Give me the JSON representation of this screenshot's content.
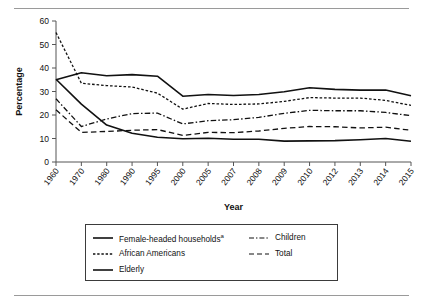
{
  "figure": {
    "has_top_rule": true,
    "has_bottom_rule": true,
    "rule_color": "#9a9a9a"
  },
  "chart_data": {
    "type": "line",
    "title": "",
    "xlabel": "Year",
    "ylabel": "Percentage",
    "categories": [
      "1960",
      "1970",
      "1980",
      "1990",
      "1995",
      "2000",
      "2005",
      "2007",
      "2008",
      "2009",
      "2010",
      "2012",
      "2013",
      "2014",
      "2015"
    ],
    "ylim": [
      0,
      60
    ],
    "yticks": [
      0,
      10,
      20,
      30,
      40,
      50,
      60
    ],
    "grid": false,
    "legend_position": "below-axes",
    "line_color": "#111111",
    "series": [
      {
        "name": "Female-headed households",
        "name_superscript": "a",
        "style": "solid",
        "values": [
          35.0,
          38.0,
          36.7,
          37.2,
          36.5,
          28.0,
          28.7,
          28.3,
          28.7,
          29.9,
          31.6,
          30.9,
          30.6,
          30.6,
          28.2
        ]
      },
      {
        "name": "African Americans",
        "style": "dotted",
        "values": [
          55.1,
          33.5,
          32.5,
          31.9,
          29.3,
          22.5,
          24.9,
          24.5,
          24.7,
          25.8,
          27.4,
          27.2,
          27.2,
          26.2,
          24.1
        ]
      },
      {
        "name": "Elderly",
        "style": "solid",
        "values": [
          35.2,
          24.6,
          15.7,
          12.2,
          10.5,
          9.9,
          10.1,
          9.7,
          9.7,
          8.9,
          9.0,
          9.1,
          9.5,
          10.0,
          8.8
        ]
      },
      {
        "name": "Children",
        "style": "dash-dot",
        "values": [
          26.9,
          15.1,
          18.3,
          20.6,
          20.8,
          16.2,
          17.6,
          18.0,
          19.0,
          20.7,
          22.0,
          21.8,
          21.8,
          21.1,
          19.7
        ]
      },
      {
        "name": "Total",
        "style": "dashed",
        "values": [
          22.2,
          12.6,
          13.0,
          13.5,
          13.8,
          11.3,
          12.6,
          12.5,
          13.2,
          14.3,
          15.1,
          15.0,
          14.5,
          14.8,
          13.5
        ]
      }
    ]
  },
  "legend": {
    "left_column": [
      {
        "label": "Female-headed households",
        "superscript": "a",
        "style": "solid"
      },
      {
        "label": "African Americans",
        "superscript": "",
        "style": "dotted"
      },
      {
        "label": "Elderly",
        "superscript": "",
        "style": "solid"
      }
    ],
    "right_column": [
      {
        "label": "Children",
        "superscript": "",
        "style": "dash-dot"
      },
      {
        "label": "Total",
        "superscript": "",
        "style": "dashed"
      }
    ]
  }
}
